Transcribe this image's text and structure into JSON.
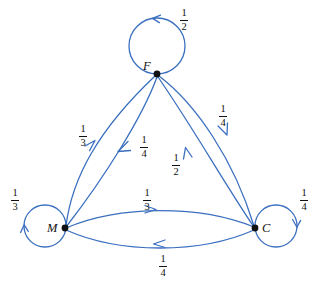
{
  "diagram": {
    "type": "markov-chain-state-diagram",
    "accent_color": "#3a6fbf",
    "node_color": "#111111",
    "label_color": "#111111",
    "background": "#ffffff",
    "nodes": [
      {
        "id": "F",
        "label": "F",
        "x": 157,
        "y": 74
      },
      {
        "id": "M",
        "label": "M",
        "x": 65,
        "y": 228
      },
      {
        "id": "C",
        "label": "C",
        "x": 255,
        "y": 228
      }
    ],
    "self_loops": [
      {
        "id": "F-loop",
        "node": "F",
        "label": "1/2",
        "numerator": "1",
        "denominator": "2",
        "label_x": 176,
        "label_y": 8,
        "direction": "counterclockwise",
        "side": "top"
      },
      {
        "id": "M-loop",
        "node": "M",
        "label": "1/3",
        "numerator": "1",
        "denominator": "3",
        "label_x": 7,
        "label_y": 188,
        "direction": "clockwise",
        "side": "left"
      },
      {
        "id": "C-loop",
        "node": "C",
        "label": "1/4",
        "numerator": "1",
        "denominator": "4",
        "label_x": 296,
        "label_y": 188,
        "direction": "clockwise",
        "side": "right"
      }
    ],
    "edges": [
      {
        "id": "M-to-F",
        "from": "M",
        "to": "F",
        "label": "1/3",
        "numerator": "1",
        "denominator": "3",
        "label_x": 75,
        "label_y": 124
      },
      {
        "id": "F-to-M",
        "from": "F",
        "to": "M",
        "label": "1/4",
        "numerator": "1",
        "denominator": "4",
        "label_x": 136,
        "label_y": 135
      },
      {
        "id": "C-to-F",
        "from": "C",
        "to": "F",
        "label": "1/2",
        "numerator": "1",
        "denominator": "2",
        "label_x": 168,
        "label_y": 153
      },
      {
        "id": "F-to-C",
        "from": "F",
        "to": "C",
        "label": "1/4",
        "numerator": "1",
        "denominator": "4",
        "label_x": 215,
        "label_y": 104
      },
      {
        "id": "M-to-C",
        "from": "M",
        "to": "C",
        "label": "1/3",
        "numerator": "1",
        "denominator": "3",
        "label_x": 139,
        "label_y": 188
      },
      {
        "id": "C-to-M",
        "from": "C",
        "to": "M",
        "label": "1/4",
        "numerator": "1",
        "denominator": "4",
        "label_x": 155,
        "label_y": 254
      }
    ]
  }
}
